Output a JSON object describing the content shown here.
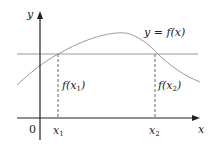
{
  "diagram": {
    "axes": {
      "x_label": "x",
      "y_label": "y",
      "origin_label": "0"
    },
    "curve": {
      "label_lhs": "y",
      "label_eq": " = ",
      "label_rhs": "f(x)"
    },
    "points": [
      {
        "tick_label": "x",
        "tick_sub": "1",
        "value_label_pre": "f(x",
        "value_label_sub": "1",
        "value_label_post": ")"
      },
      {
        "tick_label": "x",
        "tick_sub": "2",
        "value_label_pre": "f(x",
        "value_label_sub": "2",
        "value_label_post": ")"
      }
    ],
    "colors": {
      "axis": "#222222",
      "curve": "#9a9a9a",
      "horizontal_line": "#9a9a9a",
      "dashed": "#666666"
    }
  }
}
